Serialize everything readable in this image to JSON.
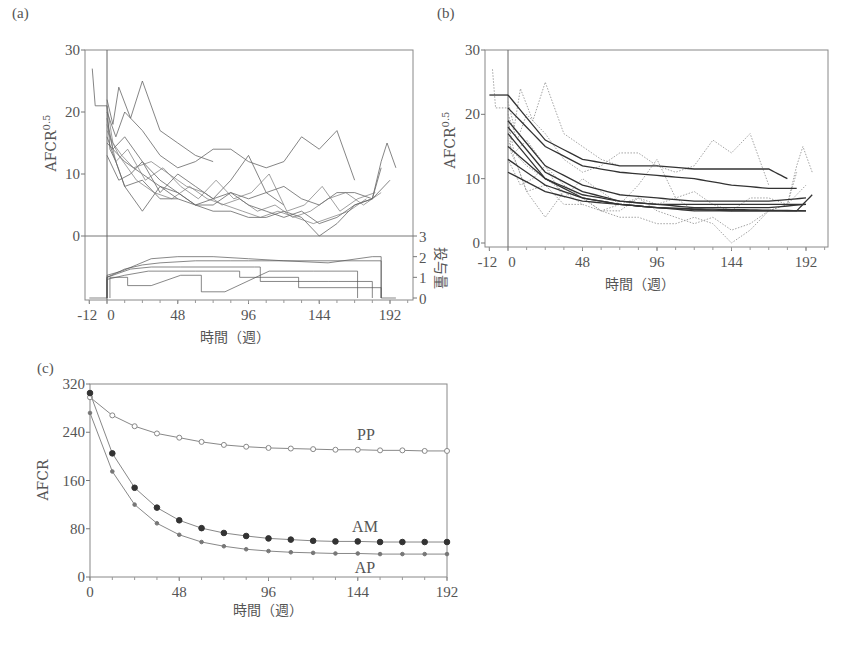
{
  "chart_data": [
    {
      "panel": "(a)",
      "type": "line",
      "title": "",
      "xlabel": "時間（週）",
      "ylabel": "AFCR^0.5",
      "ylabel_base": "AFCR",
      "ylabel_sup": "0.5",
      "y2label": "投与量",
      "xlim": [
        -12,
        200
      ],
      "ylim": [
        0,
        30
      ],
      "y2lim": [
        0,
        3
      ],
      "xticks": [
        "-12",
        "0",
        "48",
        "96",
        "144",
        "192"
      ],
      "yticks": [
        "0",
        "10",
        "20",
        "30"
      ],
      "y2ticks": [
        "0",
        "1",
        "2",
        "3"
      ],
      "grid": false,
      "reference_line_x": 0,
      "description": "Observed individual AFCR^0.5 trajectories (spaghetti plot) with dose step functions below",
      "series": [
        {
          "name": "subject-1",
          "x": [
            -10,
            -8,
            0,
            2,
            6,
            12,
            24,
            36,
            48
          ],
          "values": [
            27,
            21,
            21,
            14,
            12,
            8,
            9,
            6,
            6
          ]
        },
        {
          "name": "subject-2",
          "x": [
            0,
            4,
            8,
            16,
            24,
            36,
            48,
            60,
            72
          ],
          "values": [
            22,
            18,
            24,
            19,
            25,
            17,
            15,
            13,
            12
          ]
        },
        {
          "name": "subject-3",
          "x": [
            0,
            6,
            12,
            24,
            36,
            48,
            60,
            72,
            84,
            96,
            108,
            120,
            132,
            144,
            156,
            168
          ],
          "values": [
            20,
            16,
            20,
            17,
            13,
            11,
            12,
            14,
            14,
            12,
            11,
            12,
            16,
            14,
            17,
            9
          ]
        },
        {
          "name": "subject-4",
          "x": [
            0,
            4,
            12,
            24,
            36,
            48,
            60,
            72,
            84,
            96,
            108,
            120
          ],
          "values": [
            19,
            14,
            16,
            12,
            7,
            10,
            8,
            6,
            9,
            13,
            7,
            5
          ]
        },
        {
          "name": "subject-5",
          "x": [
            0,
            6,
            12,
            24,
            36,
            48,
            60,
            72,
            84,
            96,
            108,
            120,
            132,
            144,
            156,
            168,
            180,
            186
          ],
          "values": [
            16,
            12,
            8,
            4,
            8,
            6,
            5,
            4,
            4,
            3,
            3,
            4,
            3,
            0,
            2,
            5,
            6,
            11
          ]
        },
        {
          "name": "subject-6",
          "x": [
            0,
            8,
            16,
            24,
            36,
            48,
            60,
            72,
            84,
            96,
            108,
            120,
            132,
            144,
            156,
            168,
            180,
            192
          ],
          "values": [
            13,
            9,
            10,
            12,
            9,
            7,
            5,
            5,
            7,
            5,
            4,
            3,
            4,
            2,
            3,
            5,
            6,
            9
          ]
        },
        {
          "name": "subject-7",
          "x": [
            0,
            12,
            24,
            36,
            48,
            60,
            72,
            84,
            96,
            108,
            120,
            132,
            144,
            156,
            168,
            180,
            186,
            190,
            196
          ],
          "values": [
            15,
            12,
            10,
            8,
            7,
            5,
            6,
            7,
            6,
            7,
            8,
            6,
            5,
            7,
            7,
            6,
            12,
            15,
            11
          ]
        }
      ],
      "dose_series_note": "Step functions of dose (0–3) per subject, mostly rising from ~1 at week 0 to ~1.5–2 by week 48, stopping near week 186"
    },
    {
      "panel": "(b)",
      "type": "line",
      "title": "",
      "xlabel": "時間（週）",
      "ylabel": "AFCR^0.5",
      "ylabel_base": "AFCR",
      "ylabel_sup": "0.5",
      "xlim": [
        -12,
        200
      ],
      "ylim": [
        0,
        30
      ],
      "xticks": [
        "-12",
        "0",
        "48",
        "96",
        "144",
        "192"
      ],
      "yticks": [
        "0",
        "10",
        "20",
        "30"
      ],
      "grid": false,
      "reference_line_x": 0,
      "description": "Fitted individual exponential-decay curves (solid) over observed data (dotted)",
      "series": [
        {
          "name": "fit-1",
          "x": [
            0,
            24,
            48,
            72,
            96,
            120,
            144,
            168,
            180
          ],
          "values": [
            23,
            16,
            13,
            12,
            12,
            11.5,
            11.5,
            11.5,
            10
          ]
        },
        {
          "name": "fit-2",
          "x": [
            0,
            24,
            48,
            72,
            96,
            120,
            144,
            168,
            186
          ],
          "values": [
            21,
            15,
            12,
            11,
            10.5,
            10,
            9,
            8.5,
            8.5
          ]
        },
        {
          "name": "fit-3",
          "x": [
            0,
            24,
            48,
            72,
            96,
            120,
            144,
            168,
            192
          ],
          "values": [
            19,
            12,
            9,
            7.5,
            7,
            6.5,
            6.5,
            6.5,
            7
          ]
        },
        {
          "name": "fit-4",
          "x": [
            0,
            24,
            48,
            72,
            96,
            120,
            144,
            168,
            192
          ],
          "values": [
            18,
            11,
            8,
            6.5,
            6,
            5.5,
            5.5,
            5.5,
            6
          ]
        },
        {
          "name": "fit-5",
          "x": [
            0,
            24,
            48,
            72,
            96,
            120,
            144,
            168,
            186,
            196
          ],
          "values": [
            17,
            10,
            7,
            6,
            5.5,
            5,
            5,
            5,
            5,
            7.5
          ]
        },
        {
          "name": "fit-6",
          "x": [
            0,
            24,
            48,
            72,
            96,
            120,
            144,
            168,
            192
          ],
          "values": [
            15,
            10,
            7.5,
            6.5,
            6,
            6,
            6,
            6,
            6
          ]
        },
        {
          "name": "fit-7",
          "x": [
            0,
            24,
            48,
            72,
            96,
            120,
            144,
            168,
            192
          ],
          "values": [
            13,
            9,
            7,
            6,
            5.5,
            5.2,
            5,
            5,
            5
          ]
        },
        {
          "name": "fit-8",
          "x": [
            0,
            24,
            48,
            72,
            96,
            120,
            144,
            168,
            192
          ],
          "values": [
            11,
            8,
            6.5,
            6,
            5.5,
            5.3,
            5.2,
            5.1,
            5
          ]
        },
        {
          "name": "pre-baseline",
          "x": [
            -12,
            0
          ],
          "values": [
            23,
            23
          ]
        }
      ]
    },
    {
      "panel": "(c)",
      "type": "line",
      "title": "",
      "xlabel": "時間（週）",
      "ylabel": "AFCR",
      "xlim": [
        0,
        192
      ],
      "ylim": [
        0,
        320
      ],
      "xticks": [
        "0",
        "48",
        "96",
        "144",
        "192"
      ],
      "yticks": [
        "0",
        "80",
        "160",
        "240",
        "320"
      ],
      "grid": false,
      "x": [
        0,
        12,
        24,
        36,
        48,
        60,
        72,
        84,
        96,
        108,
        120,
        132,
        144,
        156,
        168,
        180,
        192
      ],
      "series": [
        {
          "name": "PP",
          "marker": "open-circle",
          "values": [
            298,
            268,
            250,
            238,
            231,
            224,
            219,
            216,
            214,
            213,
            212,
            211,
            211,
            210,
            210,
            209,
            209
          ]
        },
        {
          "name": "AM",
          "marker": "filled-circle",
          "values": [
            305,
            205,
            148,
            115,
            94,
            81,
            73,
            68,
            64,
            62,
            60,
            59,
            59,
            58,
            58,
            58,
            58
          ]
        },
        {
          "name": "AP",
          "marker": "small-dot",
          "values": [
            272,
            175,
            120,
            89,
            70,
            58,
            51,
            46,
            43,
            41,
            40,
            39,
            39,
            38,
            38,
            38,
            38
          ]
        }
      ]
    }
  ],
  "labels": {
    "panel_a": "(a)",
    "panel_b": "(b)",
    "panel_c": "(c)",
    "xlabel": "時間（週）",
    "ylabel_ab_base": "AFCR",
    "ylabel_ab_sup": "0.5",
    "ylabel_c": "AFCR",
    "dose_label": "投与量",
    "series_pp": "PP",
    "series_am": "AM",
    "series_ap": "AP"
  },
  "colors": {
    "axis": "#777777",
    "line": "#555555",
    "dotted": "#999999",
    "fit": "#333333"
  }
}
